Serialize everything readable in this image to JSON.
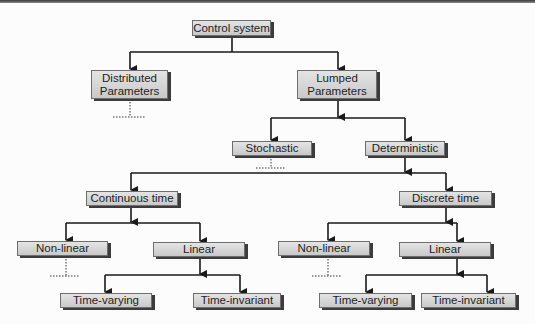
{
  "diagram": {
    "nodes": {
      "root": "Control system",
      "distributed": "Distributed\nParameters",
      "lumped": "Lumped\nParameters",
      "stochastic": "Stochastic",
      "deterministic": "Deterministic",
      "continuous": "Continuous time",
      "discrete": "Discrete time",
      "cont_nonlinear": "Non-linear",
      "cont_linear": "Linear",
      "cont_time_varying": "Time-varying",
      "cont_time_invariant": "Time-invariant",
      "disc_nonlinear": "Non-linear",
      "disc_linear": "Linear",
      "disc_time_varying": "Time-varying",
      "disc_time_invariant": "Time-invariant"
    },
    "edges": [
      [
        "root",
        "distributed"
      ],
      [
        "root",
        "lumped"
      ],
      [
        "lumped",
        "stochastic"
      ],
      [
        "lumped",
        "deterministic"
      ],
      [
        "deterministic",
        "continuous"
      ],
      [
        "deterministic",
        "discrete"
      ],
      [
        "continuous",
        "cont_nonlinear"
      ],
      [
        "continuous",
        "cont_linear"
      ],
      [
        "cont_linear",
        "cont_time_varying"
      ],
      [
        "cont_linear",
        "cont_time_invariant"
      ],
      [
        "discrete",
        "disc_nonlinear"
      ],
      [
        "discrete",
        "disc_linear"
      ],
      [
        "disc_linear",
        "disc_time_varying"
      ],
      [
        "disc_linear",
        "disc_time_invariant"
      ]
    ],
    "truncated_branches": [
      "distributed",
      "stochastic",
      "cont_nonlinear",
      "disc_nonlinear"
    ],
    "colors": {
      "box_fill": "#d6d6d6",
      "box_shadow": "#3c3c3c",
      "line": "#1a1a1a"
    }
  }
}
